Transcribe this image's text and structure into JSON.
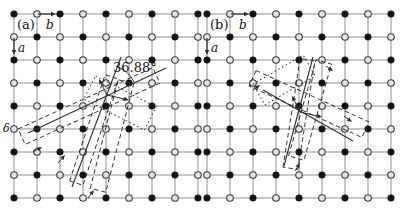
{
  "figure": {
    "kind": "square-lattice coincidence-site diagram",
    "canvas": {
      "width": 401,
      "height": 212
    },
    "colors": {
      "background": "#ffffff",
      "grid": "#8f8f8f",
      "filled_site": "#141414",
      "open_site_fill": "#e4e4e4",
      "open_site_stroke": "#3c3c3c",
      "overlay": "#2e2e2e",
      "text": "#111111"
    },
    "site_radius": 3.3,
    "panels": [
      {
        "name": "panel-a",
        "grid": {
          "origin_x": 14,
          "origin_y": 14,
          "spacing": 23,
          "cols": 9,
          "rows": 9,
          "filled_parity": 0
        },
        "texts": [
          {
            "name": "panel-label",
            "t": "(a)",
            "x": 17,
            "y": 29,
            "size": 13,
            "italic": false
          },
          {
            "name": "axis-b-label",
            "t": "b",
            "x": 46,
            "y": 29,
            "size": 12,
            "italic": true
          },
          {
            "name": "axis-a-label",
            "t": "a",
            "x": 18,
            "y": 52,
            "size": 12,
            "italic": true
          },
          {
            "name": "rotation-angle-value",
            "t": "36.88°",
            "x": 113,
            "y": 72,
            "size": 13,
            "italic": false
          },
          {
            "name": "delta-site-label",
            "t": "δ",
            "x": 3,
            "y": 132,
            "size": 11,
            "italic": true
          }
        ],
        "axis_arrows": [
          {
            "x1": 38,
            "y1": 14,
            "x2": 56,
            "y2": 14
          },
          {
            "x1": 14,
            "y1": 38,
            "x2": 14,
            "y2": 55
          }
        ],
        "solid_lines": [
          {
            "x1": 28,
            "y1": 133,
            "x2": 166,
            "y2": 68
          },
          {
            "x1": 72,
            "y1": 187,
            "x2": 121,
            "y2": 57
          }
        ],
        "supercells": [
          {
            "cx": 89,
            "cy": 106,
            "length": 148,
            "width": 17,
            "angle": -24.5,
            "style": "dashed"
          },
          {
            "cx": 94,
            "cy": 130,
            "length": 112,
            "width": 14,
            "angle": -71.5,
            "style": "dashed"
          },
          {
            "cx": 112,
            "cy": 136,
            "length": 112,
            "width": 16,
            "angle": -75.5,
            "style": "dashed"
          },
          {
            "cx": 120,
            "cy": 103,
            "length": 68,
            "width": 26,
            "angle": 27,
            "style": "dotted"
          }
        ],
        "arcs": [
          {
            "cx": 107,
            "cy": 95,
            "r": 30,
            "start_deg": -72,
            "end_deg": -25
          }
        ],
        "vector_arrows": [
          {
            "x1": 33,
            "y1": 152,
            "x2": 42,
            "y2": 147
          },
          {
            "x1": 58,
            "y1": 163,
            "x2": 65,
            "y2": 155
          },
          {
            "x1": 107,
            "y1": 95,
            "x2": 99,
            "y2": 79
          },
          {
            "x1": 107,
            "y1": 95,
            "x2": 129,
            "y2": 100
          },
          {
            "x1": 88,
            "y1": 198,
            "x2": 94,
            "y2": 190
          }
        ]
      },
      {
        "name": "panel-b",
        "grid": {
          "origin_x": 207,
          "origin_y": 14,
          "spacing": 23,
          "cols": 9,
          "rows": 9,
          "filled_parity": 0
        },
        "texts": [
          {
            "name": "panel-label",
            "t": "(b)",
            "x": 210,
            "y": 29,
            "size": 13,
            "italic": false
          },
          {
            "name": "axis-b-label",
            "t": "b",
            "x": 239,
            "y": 29,
            "size": 12,
            "italic": true
          },
          {
            "name": "axis-a-label",
            "t": "a",
            "x": 211,
            "y": 52,
            "size": 12,
            "italic": true
          }
        ],
        "axis_arrows": [
          {
            "x1": 231,
            "y1": 14,
            "x2": 249,
            "y2": 14
          },
          {
            "x1": 207,
            "y1": 38,
            "x2": 207,
            "y2": 55
          }
        ],
        "solid_lines": [
          {
            "x1": 263,
            "y1": 90,
            "x2": 353,
            "y2": 141
          },
          {
            "x1": 284,
            "y1": 166,
            "x2": 313,
            "y2": 57
          }
        ],
        "supercells": [
          {
            "cx": 309,
            "cy": 104,
            "length": 124,
            "width": 17,
            "angle": 24.5,
            "style": "dashed"
          },
          {
            "cx": 299,
            "cy": 114,
            "length": 110,
            "width": 15,
            "angle": -81,
            "style": "dashed"
          },
          {
            "cx": 310,
            "cy": 110,
            "length": 100,
            "width": 16,
            "angle": -74,
            "style": "dashed"
          },
          {
            "cx": 284,
            "cy": 80,
            "length": 58,
            "width": 24,
            "angle": -30,
            "style": "dotted"
          }
        ],
        "arcs": [],
        "vector_arrows": [
          {
            "x1": 300,
            "y1": 112,
            "x2": 292,
            "y2": 96
          },
          {
            "x1": 300,
            "y1": 112,
            "x2": 322,
            "y2": 117
          },
          {
            "x1": 253,
            "y1": 90,
            "x2": 260,
            "y2": 85
          },
          {
            "x1": 344,
            "y1": 116,
            "x2": 352,
            "y2": 122
          },
          {
            "x1": 295,
            "y1": 171,
            "x2": 300,
            "y2": 163
          },
          {
            "x1": 326,
            "y1": 66,
            "x2": 333,
            "y2": 71
          }
        ]
      }
    ]
  }
}
